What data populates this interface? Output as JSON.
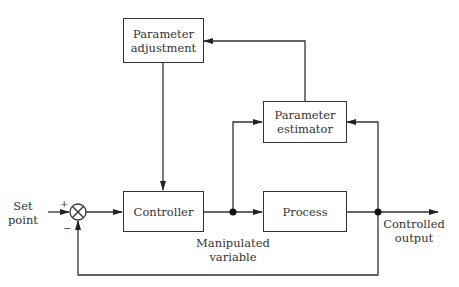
{
  "blocks": {
    "parameter_adjustment": "Parameter\nadjustment",
    "parameter_estimator": "Parameter\nestimator",
    "controller": "Controller",
    "process": "Process"
  },
  "labels": {
    "set_point": "Set\npoint",
    "manipulated_variable": "Manipulated\nvariable",
    "controlled_output": "Controlled\noutput",
    "plus": "+",
    "minus": "−"
  }
}
